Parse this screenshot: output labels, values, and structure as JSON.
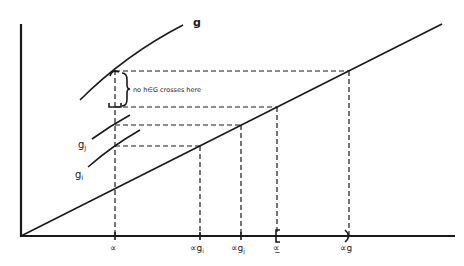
{
  "diagram": {
    "curves": {
      "g": {
        "label": "g"
      },
      "gj": {
        "label": "g",
        "subscript": "j"
      },
      "gi": {
        "label": "g",
        "subscript": "i"
      }
    },
    "annotation": "no h∈G crosses here",
    "x_ticks": [
      {
        "id": "alpha",
        "label": "∝",
        "sub": ""
      },
      {
        "id": "alpha-gi",
        "label": "∝g",
        "sub": "i"
      },
      {
        "id": "alpha-gj",
        "label": "∝g",
        "sub": "j"
      },
      {
        "id": "alpha-bar",
        "label": "∝̲",
        "sub": ""
      },
      {
        "id": "alpha-g",
        "label": "∝g",
        "sub": ""
      }
    ]
  }
}
